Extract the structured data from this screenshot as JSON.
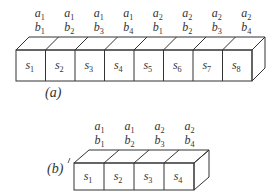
{
  "diagram_a": {
    "label": "(a)",
    "cells": [
      "s1",
      "s2",
      "s3",
      "s4",
      "s5",
      "s6",
      "s7",
      "s8"
    ],
    "top_a": [
      "a1",
      "a1",
      "a1",
      "a1",
      "a2",
      "a2",
      "a2",
      "a2"
    ],
    "top_b": [
      "b1",
      "b2",
      "b3",
      "b4",
      "b1",
      "b2",
      "b3",
      "b4"
    ]
  },
  "diagram_b": {
    "label": "(b)",
    "cells": [
      "s1",
      "s2",
      "s3",
      "s4"
    ],
    "top_a": [
      "a1",
      "a1",
      "a2",
      "a2"
    ],
    "top_b": [
      "b1",
      "b2",
      "b3",
      "b4"
    ]
  },
  "colors": {
    "stroke": "#333333",
    "background": "#ffffff"
  }
}
